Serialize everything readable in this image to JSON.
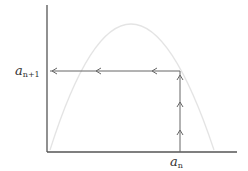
{
  "diagram": {
    "title": "",
    "labels": {
      "y_label_base": "a",
      "y_label_sub": "n+1",
      "x_label_base": "a",
      "x_label_sub": "n"
    },
    "colors": {
      "axis": "#555555",
      "arrow": "#666666",
      "curve": "#e6e6e6",
      "background": "#ffffff"
    },
    "geometry": {
      "origin": [
        47,
        152
      ],
      "y_axis_top": 5,
      "x_axis_right": 237,
      "an_x": 180,
      "an1_y": 71,
      "curve": {
        "start": [
          50,
          150
        ],
        "peak": [
          130,
          24
        ],
        "end": [
          214,
          150
        ]
      },
      "horizontal_arrowheads_x": [
        52,
        96,
        152
      ],
      "vertical_arrowheads_y": [
        76,
        103,
        131
      ]
    }
  }
}
